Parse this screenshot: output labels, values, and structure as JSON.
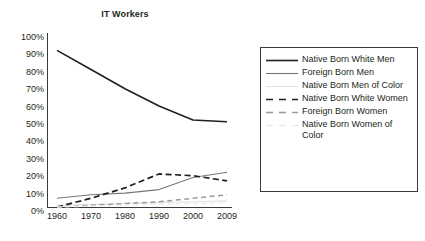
{
  "chart_data": {
    "type": "line",
    "title": "IT Workers",
    "xlabel": "",
    "ylabel": "",
    "categories": [
      "1960",
      "1970",
      "1980",
      "1990",
      "2000",
      "2009"
    ],
    "x": [
      1960,
      1970,
      1980,
      1990,
      2000,
      2009
    ],
    "ylim": [
      0,
      100
    ],
    "ytick_labels": [
      "0%",
      "10%",
      "20%",
      "30%",
      "40%",
      "50%",
      "60%",
      "70%",
      "80%",
      "90%",
      "100%"
    ],
    "ytick_values": [
      0,
      10,
      20,
      30,
      40,
      50,
      60,
      70,
      80,
      90,
      100
    ],
    "grid": false,
    "legend_position": "right",
    "axis_color": "#3a3a3a",
    "series": [
      {
        "name": "Native Born White Men",
        "values": [
          90,
          79,
          68,
          58,
          50,
          49
        ],
        "color": "#231f20",
        "style": "solid",
        "width": 1.6
      },
      {
        "name": "Foreign Born Men",
        "values": [
          5,
          7,
          8,
          10,
          17,
          20
        ],
        "color": "#777777",
        "style": "solid",
        "width": 1.1
      },
      {
        "name": "Native Born Men of Color",
        "values": [
          1,
          1.5,
          2,
          2.5,
          3,
          3.5
        ],
        "color": "#e2e2e2",
        "style": "solid",
        "width": 1.1
      },
      {
        "name": "Native Born White Women",
        "values": [
          0,
          5,
          11,
          19,
          18,
          15
        ],
        "color": "#231f20",
        "style": "dashed",
        "width": 1.7
      },
      {
        "name": "Foreign Born Women",
        "values": [
          0,
          1,
          2,
          3,
          5,
          7
        ],
        "color": "#9a9a9a",
        "style": "dashed",
        "width": 1.5
      },
      {
        "name": "Native Born Women of Color",
        "values": [
          0,
          0.5,
          1,
          1.5,
          2,
          2.5
        ],
        "color": "#ededed",
        "style": "dashed",
        "width": 1.4
      }
    ]
  },
  "legend": {
    "items": [
      {
        "label": "Native Born White Men"
      },
      {
        "label": "Foreign Born Men"
      },
      {
        "label": "Native Born Men of Color"
      },
      {
        "label": "Native Born White Women"
      },
      {
        "label": "Foreign Born Women"
      },
      {
        "label": "Native Born Women of Color"
      }
    ]
  }
}
